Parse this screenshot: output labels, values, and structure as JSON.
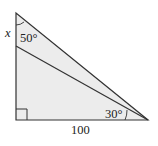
{
  "diagram": {
    "type": "right-triangle-geometry",
    "fill_color": "#ececec",
    "stroke_color": "#333333",
    "labels": {
      "x": "x",
      "angle_top": "50°",
      "angle_right": "30°",
      "base": "100"
    },
    "right_angle_marker": true
  }
}
